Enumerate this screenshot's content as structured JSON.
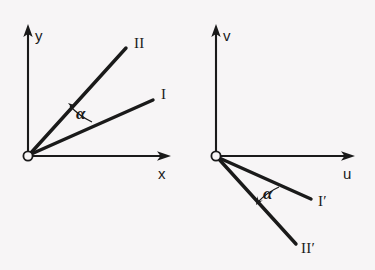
{
  "figure": {
    "background_color": "#f7f5f6",
    "ink_color": "#1a1a1a",
    "panels": [
      {
        "id": "left",
        "name": "xy-coordinate-system",
        "origin": {
          "x": 28,
          "y": 156,
          "marker": "open-circle"
        },
        "axes": [
          {
            "name": "y-axis",
            "label": "y",
            "label_x": 35,
            "label_y": 41,
            "from": {
              "x": 28,
              "y": 156
            },
            "to": {
              "x": 28,
              "y": 26
            },
            "arrow": "up"
          },
          {
            "name": "x-axis",
            "label": "x",
            "label_x": 158,
            "label_y": 179,
            "from": {
              "x": 28,
              "y": 156
            },
            "to": {
              "x": 170,
              "y": 156
            },
            "arrow": "right"
          }
        ],
        "rays": [
          {
            "name": "ray-two",
            "label": "II",
            "label_x": 134,
            "label_y": 48,
            "from": {
              "x": 28,
              "y": 156
            },
            "to": {
              "x": 126,
              "y": 48
            }
          },
          {
            "name": "ray-one",
            "label": "I",
            "label_x": 161,
            "label_y": 99,
            "from": {
              "x": 28,
              "y": 156
            },
            "to": {
              "x": 153,
              "y": 100
            }
          }
        ],
        "angle": {
          "name": "angle-alpha",
          "symbol": "α",
          "label_x": 76,
          "label_y": 119,
          "between": [
            "ray-one",
            "ray-two"
          ]
        }
      },
      {
        "id": "right",
        "name": "uv-coordinate-system",
        "origin": {
          "x": 216,
          "y": 156,
          "marker": "open-circle"
        },
        "axes": [
          {
            "name": "v-axis",
            "label": "v",
            "label_x": 223,
            "label_y": 41,
            "from": {
              "x": 216,
              "y": 156
            },
            "to": {
              "x": 216,
              "y": 26
            },
            "arrow": "up"
          },
          {
            "name": "u-axis",
            "label": "u",
            "label_x": 343,
            "label_y": 179,
            "from": {
              "x": 216,
              "y": 156
            },
            "to": {
              "x": 354,
              "y": 156
            },
            "arrow": "right"
          }
        ],
        "rays": [
          {
            "name": "ray-one-prime",
            "label": "I′",
            "label_x": 318,
            "label_y": 206,
            "from": {
              "x": 216,
              "y": 156
            },
            "to": {
              "x": 311,
              "y": 199
            }
          },
          {
            "name": "ray-two-prime",
            "label": "II′",
            "label_x": 301,
            "label_y": 253,
            "from": {
              "x": 216,
              "y": 156
            },
            "to": {
              "x": 296,
              "y": 244
            }
          }
        ],
        "angle": {
          "name": "angle-alpha-prime",
          "symbol": "α",
          "label_x": 263,
          "label_y": 199,
          "between": [
            "ray-one-prime",
            "ray-two-prime"
          ]
        }
      }
    ]
  }
}
